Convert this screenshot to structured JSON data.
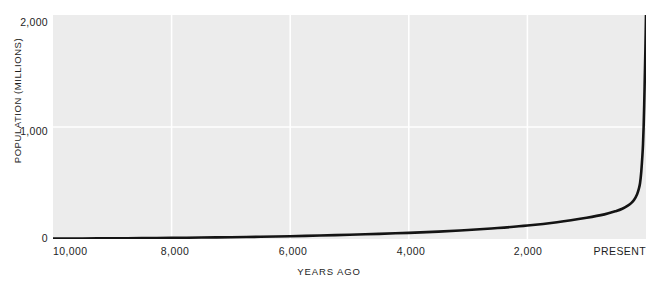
{
  "chart_data": {
    "type": "line",
    "title": "",
    "subtitle": "",
    "xlabel": "YEARS AGO",
    "ylabel": "POPULATION (MILLIONS)",
    "xlim": [
      10000,
      0
    ],
    "ylim": [
      0,
      2000
    ],
    "x_tick_labels": [
      "10,000",
      "8,000",
      "6,000",
      "4,000",
      "2,000",
      "PRESENT"
    ],
    "x_tick_values": [
      10000,
      8000,
      6000,
      4000,
      2000,
      0
    ],
    "y_tick_labels": [
      "0",
      "1,000",
      "2,000"
    ],
    "y_tick_values": [
      0,
      1000,
      2000
    ],
    "grid": true,
    "grid_color": "#ffffff",
    "grid_x_values": [
      8000,
      6000,
      4000,
      2000
    ],
    "grid_y_values": [
      1000
    ],
    "legend": null,
    "legend_position": "none",
    "plot_background": "#ececec",
    "page_background": "#ffffff",
    "annotations": [],
    "series": [
      {
        "name": "World population",
        "color": "#141414",
        "line_width": 2.6,
        "x": [
          10000,
          9500,
          9000,
          8500,
          8000,
          7500,
          7000,
          6500,
          6000,
          5500,
          5000,
          4500,
          4000,
          3500,
          3000,
          2500,
          2000,
          1500,
          1000,
          700,
          500,
          400,
          300,
          250,
          200,
          150,
          120,
          100,
          80,
          60,
          50,
          40,
          30,
          20,
          10,
          0
        ],
        "y": [
          4,
          5,
          6,
          8,
          10,
          13,
          16,
          20,
          25,
          31,
          38,
          46,
          55,
          66,
          80,
          98,
          120,
          150,
          190,
          220,
          250,
          270,
          300,
          320,
          350,
          400,
          450,
          500,
          600,
          750,
          850,
          1000,
          1200,
          1450,
          1700,
          2000
        ]
      }
    ]
  },
  "axes": {
    "y_title": "POPULATION (MILLIONS)",
    "x_title": "YEARS AGO",
    "y_labels": {
      "top": "2,000",
      "middle": "1,000",
      "bottom": "0"
    },
    "x_labels": {
      "t0": "10,000",
      "t1": "8,000",
      "t2": "6,000",
      "t3": "4,000",
      "t4": "2,000",
      "t5": "PRESENT"
    }
  },
  "colors": {
    "curve": "#141414",
    "plot_background": "#ececec",
    "gridline": "#ffffff",
    "text": "#1e1e1e"
  }
}
